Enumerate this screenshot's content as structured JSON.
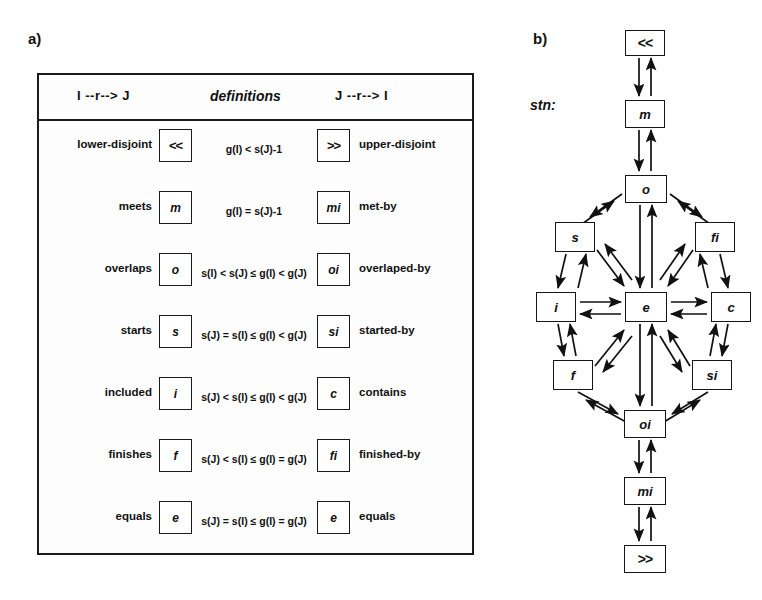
{
  "figure": {
    "panel_a_label": "a)",
    "panel_b_label": "b)",
    "stn_label": "stn:"
  },
  "table": {
    "headers": {
      "left": "I --r--> J",
      "middle": "definitions",
      "right": "J --r--> I"
    },
    "rows": [
      {
        "left_name": "lower-disjoint",
        "left_symbol": "<<",
        "definition": "g(I) < s(J)-1",
        "right_symbol": ">>",
        "right_name": "upper-disjoint"
      },
      {
        "left_name": "meets",
        "left_symbol": "m",
        "definition": "g(I) = s(J)-1",
        "right_symbol": "mi",
        "right_name": "met-by"
      },
      {
        "left_name": "overlaps",
        "left_symbol": "o",
        "definition": "s(I) < s(J) ≤ g(I) < g(J)",
        "right_symbol": "oi",
        "right_name": "overlaped-by"
      },
      {
        "left_name": "starts",
        "left_symbol": "s",
        "definition": "s(J) = s(I) ≤ g(I) < g(J)",
        "right_symbol": "si",
        "right_name": "started-by"
      },
      {
        "left_name": "included",
        "left_symbol": "i",
        "definition": "s(J) < s(I) ≤ g(I) < g(J)",
        "right_symbol": "c",
        "right_name": "contains"
      },
      {
        "left_name": "finishes",
        "left_symbol": "f",
        "definition": "s(J) < s(I) ≤ g(I) = g(J)",
        "right_symbol": "fi",
        "right_name": "finished-by"
      },
      {
        "left_name": "equals",
        "left_symbol": "e",
        "definition": "s(J) = s(I) ≤ g(I) = g(J)",
        "right_symbol": "e",
        "right_name": "equals"
      }
    ]
  },
  "graph": {
    "nodes": [
      {
        "id": "lt",
        "label": "<<",
        "x": 127,
        "y": 12,
        "w": 40,
        "h": 26
      },
      {
        "id": "m",
        "label": "m",
        "x": 127,
        "y": 82,
        "w": 40,
        "h": 28
      },
      {
        "id": "o",
        "label": "o",
        "x": 127,
        "y": 157,
        "w": 42,
        "h": 28
      },
      {
        "id": "s",
        "label": "s",
        "x": 57,
        "y": 204,
        "w": 40,
        "h": 30
      },
      {
        "id": "fi",
        "label": "fi",
        "x": 197,
        "y": 204,
        "w": 40,
        "h": 30
      },
      {
        "id": "i",
        "label": "i",
        "x": 38,
        "y": 274,
        "w": 40,
        "h": 30
      },
      {
        "id": "e",
        "label": "e",
        "x": 127,
        "y": 274,
        "w": 42,
        "h": 30
      },
      {
        "id": "c",
        "label": "c",
        "x": 213,
        "y": 274,
        "w": 40,
        "h": 30
      },
      {
        "id": "f",
        "label": "f",
        "x": 55,
        "y": 342,
        "w": 40,
        "h": 30
      },
      {
        "id": "si",
        "label": "si",
        "x": 194,
        "y": 342,
        "w": 40,
        "h": 30
      },
      {
        "id": "oi",
        "label": "oi",
        "x": 126,
        "y": 392,
        "w": 42,
        "h": 28
      },
      {
        "id": "mi",
        "label": "mi",
        "x": 126,
        "y": 459,
        "w": 42,
        "h": 28
      },
      {
        "id": "gt",
        "label": ">>",
        "x": 126,
        "y": 527,
        "w": 42,
        "h": 28
      }
    ],
    "edge_note": "all edges are bidirectional pairs"
  },
  "colors": {
    "ink": "#1a1a1a",
    "paper": "#ffffff"
  }
}
